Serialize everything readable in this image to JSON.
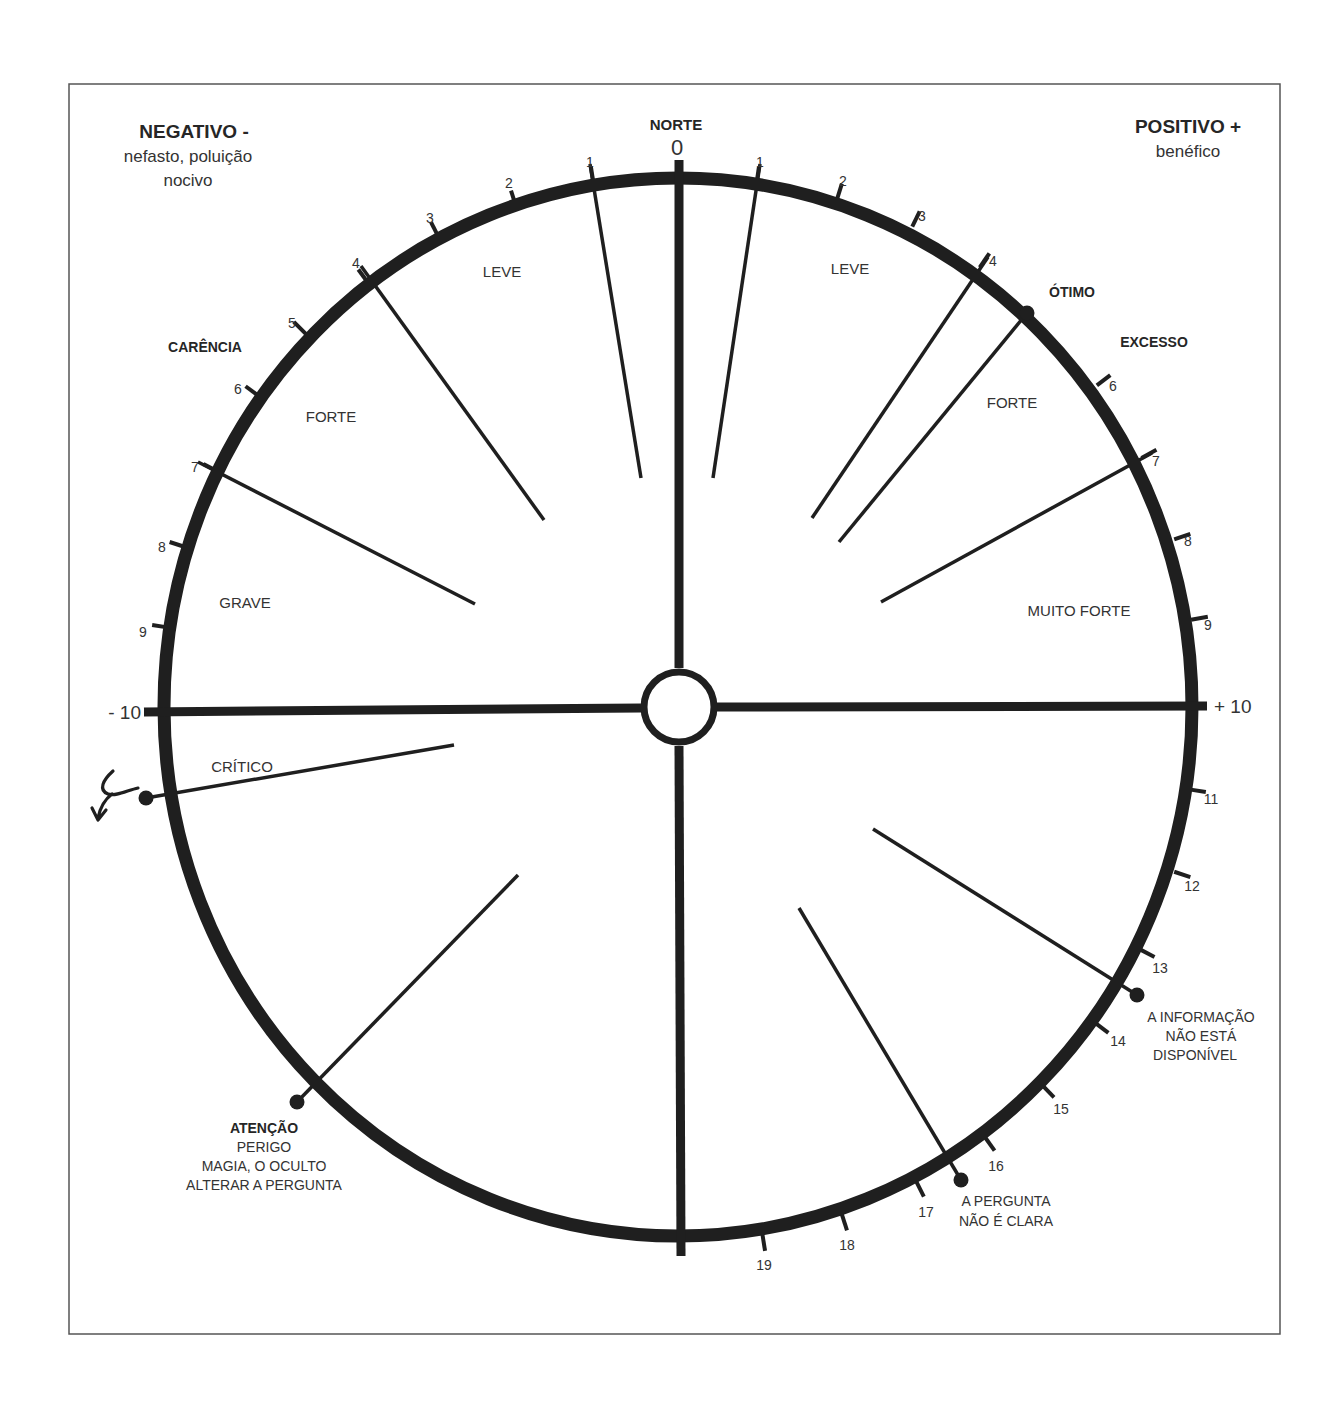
{
  "frame": {
    "x": 69,
    "y": 84,
    "width": 1211,
    "height": 1250,
    "stroke": "#555555"
  },
  "dial": {
    "cx": 678,
    "cy": 707,
    "rx": 514,
    "ry": 529,
    "ring_color": "#1f1f1f",
    "hub_r": 35
  },
  "headers": {
    "negative": {
      "title": "NEGATIVO -",
      "line1": "nefasto, poluição",
      "line2": "nocivo"
    },
    "positive": {
      "title": "POSITIVO +",
      "line1": "benéfico"
    },
    "north": "NORTE",
    "zero": "0"
  },
  "axis_labels": {
    "minus_ten": "- 10",
    "plus_ten": "+ 10"
  },
  "zones": {
    "left": [
      {
        "text": "LEVE",
        "x": 502,
        "y": 277
      },
      {
        "text": "FORTE",
        "x": 331,
        "y": 422
      },
      {
        "text": "GRAVE",
        "x": 245,
        "y": 608
      },
      {
        "text": "CRÍTICO",
        "x": 242,
        "y": 772
      }
    ],
    "right": [
      {
        "text": "LEVE",
        "x": 850,
        "y": 274
      },
      {
        "text": "FORTE",
        "x": 1012,
        "y": 408
      },
      {
        "text": "MUITO FORTE",
        "x": 1079,
        "y": 616
      }
    ]
  },
  "callouts": {
    "carencia": "CARÊNCIA",
    "otimo": "ÓTIMO",
    "excesso": "EXCESSO",
    "atencao": {
      "title": "ATENÇÃO",
      "lines": [
        "PERIGO",
        "MAGIA, O OCULTO",
        "ALTERAR A PERGUNTA"
      ]
    },
    "info": {
      "lines": [
        "A INFORMAÇÃO",
        "NÃO ESTÁ",
        "DISPONÍVEL"
      ]
    },
    "pergunta": {
      "lines": [
        "A PERGUNTA",
        "NÃO É CLARA"
      ]
    }
  },
  "ticks_left": [
    {
      "label": "1",
      "x": 593,
      "y": 180,
      "tx": 590,
      "ty": 162
    },
    {
      "label": "2",
      "x": 515,
      "y": 203,
      "tx": 509,
      "ty": 183
    },
    {
      "label": "3",
      "x": 437,
      "y": 234,
      "tx": 430,
      "ty": 218
    },
    {
      "label": "4",
      "x": 366,
      "y": 280,
      "tx": 356,
      "ty": 263
    },
    {
      "label": "5",
      "x": 303,
      "y": 331,
      "tx": 292,
      "ty": 323
    },
    {
      "label": "6",
      "x": 256,
      "y": 394,
      "tx": 238,
      "ty": 389
    },
    {
      "label": "7",
      "x": 215,
      "y": 470,
      "tx": 195,
      "ty": 467
    },
    {
      "label": "8",
      "x": 182,
      "y": 546,
      "tx": 162,
      "ty": 547
    },
    {
      "label": "9",
      "x": 165,
      "y": 627,
      "tx": 143,
      "ty": 632
    }
  ],
  "ticks_right": [
    {
      "label": "1",
      "x": 757,
      "y": 180,
      "tx": 760,
      "ty": 162
    },
    {
      "label": "2",
      "x": 838,
      "y": 196,
      "tx": 843,
      "ty": 181
    },
    {
      "label": "3",
      "x": 914,
      "y": 223,
      "tx": 922,
      "ty": 216
    },
    {
      "label": "4",
      "x": 982,
      "y": 264,
      "tx": 993,
      "ty": 261
    },
    {
      "label": "6",
      "x": 1100,
      "y": 383,
      "tx": 1113,
      "ty": 386
    },
    {
      "label": "7",
      "x": 1145,
      "y": 456,
      "tx": 1156,
      "ty": 461
    },
    {
      "label": "8",
      "x": 1178,
      "y": 538,
      "tx": 1188,
      "ty": 541
    },
    {
      "label": "9",
      "x": 1195,
      "y": 619,
      "tx": 1208,
      "ty": 625
    },
    {
      "label": "11",
      "x": 1193,
      "y": 790,
      "tx": 1211,
      "ty": 799
    },
    {
      "label": "12",
      "x": 1178,
      "y": 873,
      "tx": 1192,
      "ty": 886
    },
    {
      "label": "13",
      "x": 1143,
      "y": 951,
      "tx": 1160,
      "ty": 968
    },
    {
      "label": "14",
      "x": 1098,
      "y": 1025,
      "tx": 1118,
      "ty": 1041
    },
    {
      "label": "15",
      "x": 1045,
      "y": 1088,
      "tx": 1061,
      "ty": 1109
    },
    {
      "label": "16",
      "x": 987,
      "y": 1140,
      "tx": 996,
      "ty": 1166
    },
    {
      "label": "17",
      "x": 918,
      "y": 1185,
      "tx": 926,
      "ty": 1212
    },
    {
      "label": "18",
      "x": 843,
      "y": 1218,
      "tx": 847,
      "ty": 1245
    },
    {
      "label": "19",
      "x": 763,
      "y": 1238,
      "tx": 764,
      "ty": 1265
    }
  ],
  "spokes": [
    {
      "name": "spoke-left-1",
      "x1": 641,
      "y1": 478,
      "x2": 590,
      "y2": 164
    },
    {
      "name": "spoke-left-4",
      "x1": 544,
      "y1": 520,
      "x2": 361,
      "y2": 266
    },
    {
      "name": "spoke-left-7",
      "x1": 475,
      "y1": 604,
      "x2": 198,
      "y2": 462
    },
    {
      "name": "spoke-critico",
      "x1": 454,
      "y1": 745,
      "x2": 146,
      "y2": 798
    },
    {
      "name": "spoke-atencao",
      "x1": 518,
      "y1": 875,
      "x2": 297,
      "y2": 1102
    },
    {
      "name": "spoke-right-1",
      "x1": 713,
      "y1": 478,
      "x2": 760,
      "y2": 164
    },
    {
      "name": "spoke-right-4",
      "x1": 812,
      "y1": 518,
      "x2": 988,
      "y2": 257
    },
    {
      "name": "spoke-otimo",
      "x1": 839,
      "y1": 542,
      "x2": 1027,
      "y2": 313
    },
    {
      "name": "spoke-right-7",
      "x1": 881,
      "y1": 602,
      "x2": 1152,
      "y2": 453
    },
    {
      "name": "spoke-info",
      "x1": 873,
      "y1": 829,
      "x2": 1137,
      "y2": 995
    },
    {
      "name": "spoke-pergunta",
      "x1": 799,
      "y1": 908,
      "x2": 961,
      "y2": 1180
    }
  ],
  "markers": [
    {
      "name": "marker-otimo",
      "x": 1027,
      "y": 313
    },
    {
      "name": "marker-critico",
      "x": 146,
      "y": 798
    },
    {
      "name": "marker-atencao",
      "x": 297,
      "y": 1102
    },
    {
      "name": "marker-info",
      "x": 1137,
      "y": 995
    },
    {
      "name": "marker-pergunta",
      "x": 961,
      "y": 1180
    }
  ]
}
